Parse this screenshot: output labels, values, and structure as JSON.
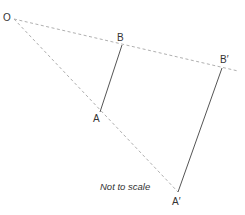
{
  "diagram": {
    "labels": {
      "O": "O",
      "B": "B",
      "A": "A",
      "B_prime": "B′",
      "A_prime": "A′"
    },
    "note": "Not to scale",
    "points": {
      "O": [
        14,
        19
      ],
      "B": [
        122,
        45
      ],
      "A": [
        100,
        112
      ],
      "B_prime": [
        222,
        68
      ],
      "A_prime": [
        178,
        192
      ]
    },
    "colors": {
      "dashed_line": "#b0b0b0",
      "solid_line": "#555555",
      "text": "#333333"
    },
    "segments": [
      {
        "from": "O",
        "to": "B_prime",
        "style": "dashed"
      },
      {
        "from": "O",
        "to": "A_prime",
        "style": "dashed"
      },
      {
        "from": "B",
        "to": "A",
        "style": "solid"
      },
      {
        "from": "B_prime",
        "to": "A_prime",
        "style": "solid"
      }
    ]
  }
}
